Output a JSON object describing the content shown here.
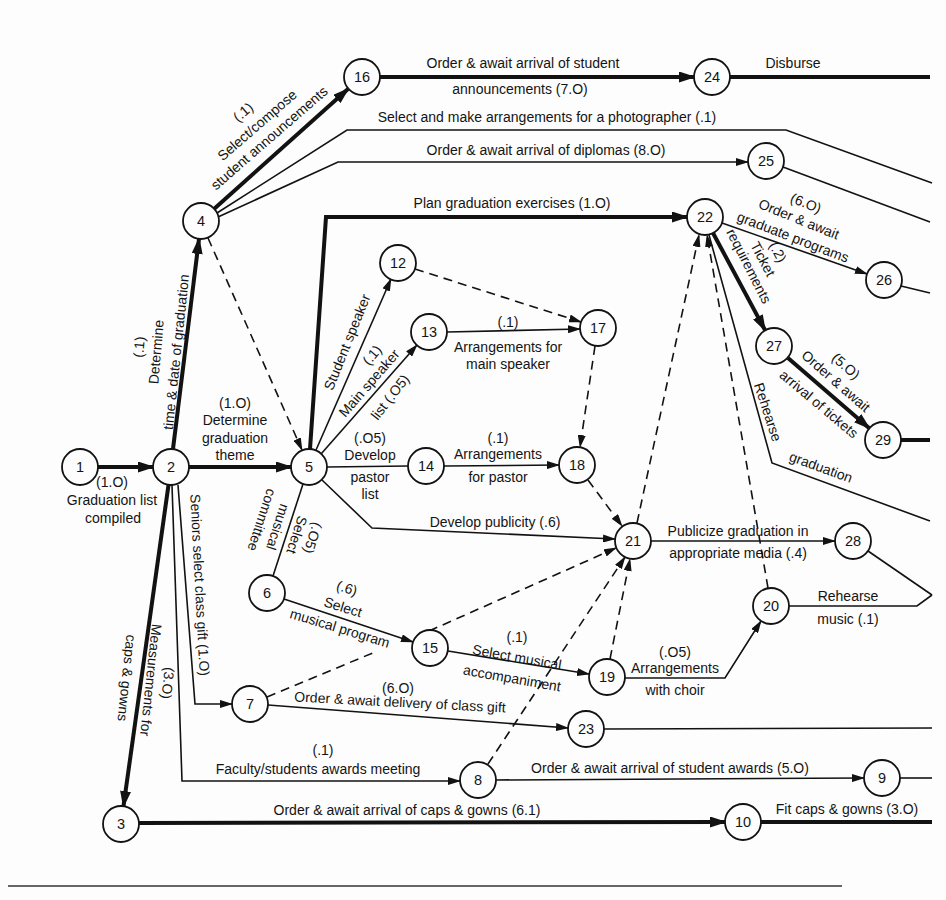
{
  "nodes": {
    "n1": "1",
    "n2": "2",
    "n3": "3",
    "n4": "4",
    "n5": "5",
    "n6": "6",
    "n7": "7",
    "n8": "8",
    "n9": "9",
    "n10": "10",
    "n12": "12",
    "n13": "13",
    "n14": "14",
    "n15": "15",
    "n16": "16",
    "n17": "17",
    "n18": "18",
    "n19": "19",
    "n20": "20",
    "n21": "21",
    "n22": "22",
    "n23": "23",
    "n24": "24",
    "n25": "25",
    "n26": "26",
    "n27": "27",
    "n28": "28",
    "n29": "29"
  },
  "activities": {
    "1-2": {
      "from": "1",
      "to": "2",
      "kind": "critical",
      "lines": [
        "(1.O)",
        "Graduation list",
        "compiled"
      ]
    },
    "2-4": {
      "from": "2",
      "to": "4",
      "kind": "critical",
      "lines": [
        "(.1)",
        "Determine",
        "time & date of graduation"
      ]
    },
    "2-5": {
      "from": "2",
      "to": "5",
      "kind": "critical",
      "lines": [
        "(1.O)",
        "Determine",
        "graduation",
        "theme"
      ]
    },
    "2-3": {
      "from": "2",
      "to": "3",
      "kind": "critical",
      "lines": [
        "(3.O)",
        "Measurements for",
        "caps & gowns"
      ]
    },
    "2-7": {
      "from": "2",
      "to": "7",
      "kind": "normal",
      "lines": [
        "Seniors select class gift (1.O)"
      ]
    },
    "2-8": {
      "from": "2",
      "to": "8",
      "kind": "normal",
      "lines": [
        "(.1)",
        "Faculty/students awards meeting"
      ]
    },
    "4-16": {
      "from": "4",
      "to": "16",
      "kind": "critical",
      "lines": [
        "(.1)",
        "Select/compose",
        "student announcements"
      ]
    },
    "4-photo": {
      "from": "4",
      "kind": "normal",
      "lines": [
        "Select and make arrangements for a photographer (.1)"
      ]
    },
    "4-25": {
      "from": "4",
      "to": "25",
      "kind": "normal",
      "lines": [
        "Order & await arrival of diplomas (8.O)"
      ]
    },
    "4-5": {
      "from": "4",
      "to": "5",
      "kind": "dummy",
      "lines": []
    },
    "5-22": {
      "from": "5",
      "to": "22",
      "kind": "critical",
      "lines": [
        "Plan graduation exercises (1.O)"
      ]
    },
    "5-12": {
      "from": "5",
      "to": "12",
      "kind": "normal",
      "lines": [
        "Student speaker",
        "(.1)"
      ]
    },
    "5-13": {
      "from": "5",
      "to": "13",
      "kind": "normal",
      "lines": [
        "Main speaker",
        "list (.O5)"
      ]
    },
    "5-14": {
      "from": "5",
      "to": "14",
      "kind": "normal",
      "lines": [
        "(.O5)",
        "Develop",
        "pastor",
        "list"
      ]
    },
    "5-21": {
      "from": "5",
      "to": "21",
      "kind": "normal",
      "lines": [
        "Develop publicity (.6)"
      ]
    },
    "5-6": {
      "from": "5",
      "to": "6",
      "kind": "normal",
      "lines": [
        "(.O5)",
        "Select",
        "musical",
        "committee"
      ]
    },
    "6-15": {
      "from": "6",
      "to": "15",
      "kind": "normal",
      "lines": [
        "(.6)",
        "Select",
        "musical program"
      ]
    },
    "7-15": {
      "from": "7",
      "to": "15",
      "kind": "dummy",
      "lines": []
    },
    "7-23": {
      "from": "7",
      "to": "23",
      "kind": "normal",
      "lines": [
        "(6.O)",
        "Order & await delivery of class gift"
      ]
    },
    "8-9": {
      "from": "8",
      "to": "9",
      "kind": "normal",
      "lines": [
        "Order & await arrival of student awards (5.O)"
      ]
    },
    "8-21": {
      "from": "8",
      "to": "21",
      "kind": "dummy",
      "lines": []
    },
    "3-10": {
      "from": "3",
      "to": "10",
      "kind": "critical",
      "lines": [
        "Order & await arrival of caps & gowns (6.1)"
      ]
    },
    "10-out": {
      "from": "10",
      "kind": "critical",
      "lines": [
        "Fit caps & gowns (3.O)"
      ]
    },
    "12-17": {
      "from": "12",
      "to": "17",
      "kind": "dummy",
      "lines": []
    },
    "13-17": {
      "from": "13",
      "to": "17",
      "kind": "normal",
      "lines": [
        "(.1)",
        "Arrangements for",
        "main speaker"
      ]
    },
    "14-18": {
      "from": "14",
      "to": "18",
      "kind": "normal",
      "lines": [
        "(.1)",
        "Arrangements",
        "for pastor"
      ]
    },
    "17-18": {
      "from": "17",
      "to": "18",
      "kind": "dummy",
      "lines": []
    },
    "18-21": {
      "from": "18",
      "to": "21",
      "kind": "dummy",
      "lines": []
    },
    "15-19": {
      "from": "15",
      "to": "19",
      "kind": "normal",
      "lines": [
        "(.1)",
        "Select musical",
        "accompaniment"
      ]
    },
    "15-21": {
      "from": "15",
      "to": "21",
      "kind": "dummy",
      "lines": []
    },
    "19-20": {
      "from": "19",
      "to": "20",
      "kind": "normal",
      "lines": [
        "(.O5)",
        "Arrangements",
        "with choir"
      ]
    },
    "19-21": {
      "from": "19",
      "to": "21",
      "kind": "dummy",
      "lines": []
    },
    "16-24": {
      "from": "16",
      "to": "24",
      "kind": "critical",
      "lines": [
        "Order & await arrival of student",
        "announcements (7.O)"
      ]
    },
    "24-out": {
      "from": "24",
      "kind": "critical",
      "lines": [
        "Disburse"
      ]
    },
    "21-22": {
      "from": "21",
      "to": "22",
      "kind": "dummy",
      "lines": []
    },
    "21-28": {
      "from": "21",
      "to": "28",
      "kind": "normal",
      "lines": [
        "Publicize graduation in",
        "appropriate media (.4)"
      ]
    },
    "20-22": {
      "from": "20",
      "to": "22",
      "kind": "dummy",
      "lines": []
    },
    "20-out": {
      "from": "20",
      "kind": "normal",
      "lines": [
        "Rehearse",
        "music (.1)"
      ]
    },
    "28-out": {
      "from": "28",
      "kind": "normal",
      "lines": []
    },
    "22-26": {
      "from": "22",
      "to": "26",
      "kind": "normal",
      "lines": [
        "(6.O)",
        "Order & await",
        "graduate programs"
      ]
    },
    "22-27": {
      "from": "22",
      "to": "27",
      "kind": "critical",
      "lines": [
        "(.2)",
        "Ticket",
        "requirements"
      ]
    },
    "22-out": {
      "from": "22",
      "kind": "normal",
      "lines": [
        "Rehearse",
        "graduation"
      ]
    },
    "27-29": {
      "from": "27",
      "to": "29",
      "kind": "critical",
      "lines": [
        "(5.O)",
        "Order & await",
        "arrival of tickets"
      ]
    },
    "29-out": {
      "from": "29",
      "kind": "critical",
      "lines": []
    },
    "26-out": {
      "from": "26",
      "kind": "normal",
      "lines": []
    },
    "25-out": {
      "from": "25",
      "kind": "normal",
      "lines": []
    },
    "23-out": {
      "from": "23",
      "kind": "normal",
      "lines": []
    },
    "9-out": {
      "from": "9",
      "kind": "normal",
      "lines": []
    }
  }
}
